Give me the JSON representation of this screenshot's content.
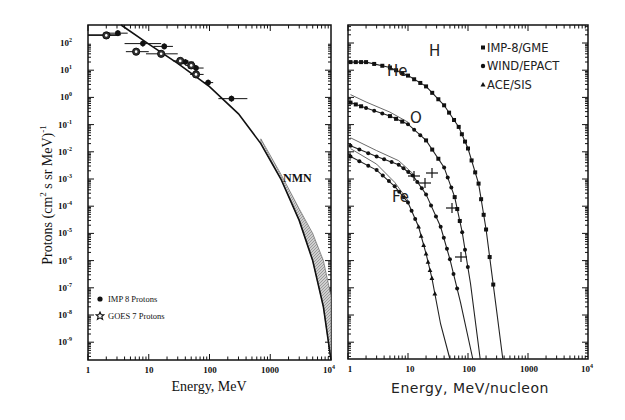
{
  "chart_data": [
    {
      "type": "scatter",
      "panel": "left",
      "title": "",
      "xlabel": "Energy, MeV",
      "ylabel": "Protons (cm² s sr MeV)⁻¹",
      "xscale": "log",
      "yscale": "log",
      "xlim": [
        1,
        10000
      ],
      "ylim": [
        2.2e-10,
        460
      ],
      "x_ticks": [
        "1",
        "10",
        "100",
        "1000",
        "10⁴"
      ],
      "y_ticks": [
        "10²",
        "10¹",
        "10⁰",
        "10⁻¹",
        "10⁻²",
        "10⁻³",
        "10⁻⁴",
        "10⁻⁵",
        "10⁻⁶",
        "10⁻⁷",
        "10⁻⁸",
        "10⁻⁹"
      ],
      "grid": false,
      "legend_position": "lower-left",
      "legend": [
        "IMP 8 Protons",
        "GOES 7 Protons"
      ],
      "annotations": [
        "NMN"
      ],
      "series": [
        {
          "name": "IMP 8 Protons",
          "marker": "filled-circle",
          "points": [
            {
              "x": 2.1,
              "y": 200,
              "xerr": [
                1.0,
                3.5
              ]
            },
            {
              "x": 3.1,
              "y": 230,
              "xerr": [
                2.2,
                4.5
              ]
            },
            {
              "x": 8.0,
              "y": 95,
              "xerr": [
                4.0,
                16
              ]
            },
            {
              "x": 18,
              "y": 75,
              "xerr": [
                12,
                25
              ]
            },
            {
              "x": 40,
              "y": 20,
              "xerr": [
                28,
                55
              ]
            },
            {
              "x": 60,
              "y": 12,
              "xerr": [
                45,
                80
              ]
            },
            {
              "x": 95,
              "y": 3.5,
              "xerr": [
                80,
                115
              ]
            },
            {
              "x": 230,
              "y": 0.9,
              "xerr": [
                140,
                420
              ]
            }
          ]
        },
        {
          "name": "GOES 7 Protons",
          "marker": "open-star",
          "points": [
            {
              "x": 2.0,
              "y": 190,
              "xerr": [
                1.0,
                3.0
              ]
            },
            {
              "x": 6.2,
              "y": 48,
              "xerr": [
                4.2,
                10
              ]
            },
            {
              "x": 16,
              "y": 40,
              "xerr": [
                9,
                30
              ]
            },
            {
              "x": 33,
              "y": 22,
              "xerr": [
                25,
                45
              ]
            },
            {
              "x": 50,
              "y": 15,
              "xerr": [
                40,
                60
              ]
            },
            {
              "x": 60,
              "y": 7,
              "xerr": [
                48,
                80
              ]
            }
          ]
        },
        {
          "name": "Model fit",
          "type": "line",
          "points": [
            {
              "x": 3.5,
              "y": 460
            },
            {
              "x": 10,
              "y": 90
            },
            {
              "x": 30,
              "y": 18
            },
            {
              "x": 100,
              "y": 2.5
            },
            {
              "x": 300,
              "y": 0.25
            },
            {
              "x": 700,
              "y": 0.02
            },
            {
              "x": 1500,
              "y": 0.001
            },
            {
              "x": 3000,
              "y": 3e-05
            },
            {
              "x": 5000,
              "y": 1e-06
            },
            {
              "x": 7500,
              "y": 2e-08
            },
            {
              "x": 10000,
              "y": 2.2e-10
            }
          ]
        },
        {
          "name": "NMN band",
          "type": "area",
          "upper": [
            {
              "x": 700,
              "y": 0.03
            },
            {
              "x": 1500,
              "y": 0.0015
            },
            {
              "x": 3000,
              "y": 8e-05
            },
            {
              "x": 5000,
              "y": 1e-05
            },
            {
              "x": 7500,
              "y": 1e-06
            },
            {
              "x": 10000,
              "y": 5e-08
            }
          ],
          "lower": [
            {
              "x": 700,
              "y": 0.02
            },
            {
              "x": 1500,
              "y": 0.001
            },
            {
              "x": 3000,
              "y": 3e-05
            },
            {
              "x": 5000,
              "y": 1e-06
            },
            {
              "x": 7500,
              "y": 2e-08
            },
            {
              "x": 10000,
              "y": 2.2e-10
            }
          ]
        }
      ]
    },
    {
      "type": "scatter",
      "panel": "right",
      "title": "",
      "xlabel": "Energy, MeV/nucleon",
      "ylabel": "",
      "xscale": "log",
      "yscale": "log",
      "xlim": [
        1,
        10000
      ],
      "ylim_decades_relative": [
        -12.3,
        0
      ],
      "x_ticks": [
        "1",
        "10",
        "100",
        "1000",
        "10⁴"
      ],
      "y_ticks": [],
      "grid": false,
      "legend_position": "upper-right",
      "legend": [
        "IMP-8/GME",
        "WIND/EPACT",
        "ACE/SIS"
      ],
      "series_labels": [
        "H",
        "He",
        "O",
        "Fe"
      ],
      "series": [
        {
          "name": "H",
          "points_decades_below_top": [
            {
              "x": 1.1,
              "y": -1.3
            },
            {
              "x": 2,
              "y": -1.3
            },
            {
              "x": 5,
              "y": -1.5
            },
            {
              "x": 10,
              "y": -1.8
            },
            {
              "x": 20,
              "y": -2.2
            },
            {
              "x": 40,
              "y": -2.9
            },
            {
              "x": 70,
              "y": -3.7
            },
            {
              "x": 100,
              "y": -4.5
            },
            {
              "x": 150,
              "y": -5.8
            },
            {
              "x": 200,
              "y": -7.5
            },
            {
              "x": 300,
              "y": -10.5
            },
            {
              "x": 380,
              "y": -12.3
            }
          ]
        },
        {
          "name": "He",
          "points_decades_below_top": [
            {
              "x": 1.1,
              "y": -2.8
            },
            {
              "x": 2,
              "y": -3.0
            },
            {
              "x": 5,
              "y": -3.3
            },
            {
              "x": 10,
              "y": -3.6
            },
            {
              "x": 20,
              "y": -4.2
            },
            {
              "x": 40,
              "y": -5.2
            },
            {
              "x": 60,
              "y": -6.3
            },
            {
              "x": 80,
              "y": -7.6
            },
            {
              "x": 110,
              "y": -9.5
            },
            {
              "x": 160,
              "y": -12.3
            }
          ]
        },
        {
          "name": "O",
          "points_decades_below_top": [
            {
              "x": 1.1,
              "y": -4.4
            },
            {
              "x": 3,
              "y": -4.8
            },
            {
              "x": 7,
              "y": -5.1
            },
            {
              "x": 12,
              "y": -5.5
            },
            {
              "x": 20,
              "y": -6.2
            },
            {
              "x": 35,
              "y": -7.4
            },
            {
              "x": 50,
              "y": -8.6
            },
            {
              "x": 75,
              "y": -10.2
            },
            {
              "x": 120,
              "y": -12.3
            }
          ]
        },
        {
          "name": "Fe",
          "points_decades_below_top": [
            {
              "x": 1.1,
              "y": -4.8
            },
            {
              "x": 3,
              "y": -5.3
            },
            {
              "x": 6,
              "y": -5.9
            },
            {
              "x": 10,
              "y": -6.5
            },
            {
              "x": 15,
              "y": -7.4
            },
            {
              "x": 20,
              "y": -8.4
            },
            {
              "x": 25,
              "y": -9.3
            },
            {
              "x": 35,
              "y": -11.0
            },
            {
              "x": 50,
              "y": -12.3
            }
          ]
        }
      ]
    }
  ],
  "left_panel": {
    "ylabel_main": "Protons (cm",
    "ylabel_sup": "2",
    "ylabel_rest": " s sr MeV)",
    "ylabel_exp": "-1",
    "xlabel": "Energy, MeV",
    "x_ticks": [
      "1",
      "10",
      "100",
      "1000",
      "10"
    ],
    "x_last_exp": "4",
    "y_ticks": [
      "2",
      "1",
      "0",
      "-1",
      "-2",
      "-3",
      "-4",
      "-5",
      "-6",
      "-7",
      "-8",
      "-9"
    ],
    "legend": [
      {
        "label": "IMP 8 Protons",
        "marker": "filled-circle"
      },
      {
        "label": "GOES 7 Protons",
        "marker": "open-star"
      }
    ],
    "annotation": "NMN"
  },
  "right_panel": {
    "xlabel": "Energy, MeV/nucleon",
    "x_ticks": [
      "1",
      "10",
      "100",
      "1000",
      "10"
    ],
    "x_last_exp": "4",
    "legend": [
      {
        "label": "IMP-8/GME",
        "marker": "square"
      },
      {
        "label": "WIND/EPACT",
        "marker": "circle"
      },
      {
        "label": "ACE/SIS",
        "marker": "triangle"
      }
    ],
    "species": [
      "H",
      "He",
      "O",
      "Fe"
    ]
  }
}
